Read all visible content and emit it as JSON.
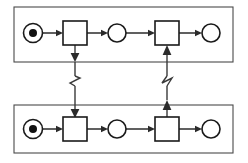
{
  "diagram": {
    "type": "petri-net",
    "canvas": {
      "width": 248,
      "height": 163,
      "background": "#ffffff"
    },
    "colors": {
      "lane_stroke": "#4a4a4a",
      "node_stroke": "#1a1a1a",
      "arc_stroke": "#2b2b2b",
      "message_stroke": "#3a3a3a",
      "token_fill": "#111111",
      "node_fill": "#ffffff"
    },
    "lanes": [
      {
        "id": "lane-top",
        "name": "top-pool",
        "x": 14,
        "y": 7,
        "width": 219,
        "height": 55
      },
      {
        "id": "lane-bottom",
        "name": "bottom-pool",
        "x": 14,
        "y": 105,
        "width": 219,
        "height": 48
      }
    ],
    "nodes": [
      {
        "id": "p-top-start",
        "kind": "place",
        "lane": "lane-top",
        "cx": 33,
        "cy": 33,
        "r": 9.5,
        "tokens": 1,
        "token_r": 4,
        "label": ""
      },
      {
        "id": "t-top-1",
        "kind": "transition",
        "lane": "lane-top",
        "x": 63,
        "y": 21,
        "width": 24,
        "height": 24,
        "label": ""
      },
      {
        "id": "p-top-mid",
        "kind": "place",
        "lane": "lane-top",
        "cx": 117,
        "cy": 33,
        "r": 9,
        "tokens": 0,
        "label": ""
      },
      {
        "id": "t-top-2",
        "kind": "transition",
        "lane": "lane-top",
        "x": 155,
        "y": 21,
        "width": 24,
        "height": 24,
        "label": ""
      },
      {
        "id": "p-top-end",
        "kind": "place",
        "lane": "lane-top",
        "cx": 211,
        "cy": 33,
        "r": 9,
        "tokens": 0,
        "label": ""
      },
      {
        "id": "p-bot-start",
        "kind": "place",
        "lane": "lane-bottom",
        "cx": 33,
        "cy": 129,
        "r": 9.5,
        "tokens": 1,
        "token_r": 4,
        "label": ""
      },
      {
        "id": "t-bot-1",
        "kind": "transition",
        "lane": "lane-bottom",
        "x": 63,
        "y": 117,
        "width": 24,
        "height": 24,
        "label": ""
      },
      {
        "id": "p-bot-mid",
        "kind": "place",
        "lane": "lane-bottom",
        "cx": 117,
        "cy": 129,
        "r": 9,
        "tokens": 0,
        "label": ""
      },
      {
        "id": "t-bot-2",
        "kind": "transition",
        "lane": "lane-bottom",
        "x": 155,
        "y": 117,
        "width": 24,
        "height": 24,
        "label": ""
      },
      {
        "id": "p-bot-end",
        "kind": "place",
        "lane": "lane-bottom",
        "cx": 211,
        "cy": 129,
        "r": 9,
        "tokens": 0,
        "label": ""
      }
    ],
    "arcs": [
      {
        "id": "arc-top-1",
        "from": "p-top-start",
        "to": "t-top-1",
        "orientation": "horizontal",
        "x1": 43,
        "y1": 33,
        "x2": 63,
        "y2": 33
      },
      {
        "id": "arc-top-2",
        "from": "t-top-1",
        "to": "p-top-mid",
        "orientation": "horizontal",
        "x1": 87,
        "y1": 33,
        "x2": 108,
        "y2": 33
      },
      {
        "id": "arc-top-3",
        "from": "p-top-mid",
        "to": "t-top-2",
        "orientation": "horizontal",
        "x1": 126,
        "y1": 33,
        "x2": 155,
        "y2": 33
      },
      {
        "id": "arc-top-4",
        "from": "t-top-2",
        "to": "p-top-end",
        "orientation": "horizontal",
        "x1": 179,
        "y1": 33,
        "x2": 202,
        "y2": 33
      },
      {
        "id": "arc-bot-1",
        "from": "p-bot-start",
        "to": "t-bot-1",
        "orientation": "horizontal",
        "x1": 43,
        "y1": 129,
        "x2": 63,
        "y2": 129
      },
      {
        "id": "arc-bot-2",
        "from": "t-bot-1",
        "to": "p-bot-mid",
        "orientation": "horizontal",
        "x1": 87,
        "y1": 129,
        "x2": 108,
        "y2": 129
      },
      {
        "id": "arc-bot-3",
        "from": "p-bot-mid",
        "to": "t-bot-2",
        "orientation": "horizontal",
        "x1": 126,
        "y1": 129,
        "x2": 155,
        "y2": 129
      },
      {
        "id": "arc-bot-4",
        "from": "t-bot-2",
        "to": "p-bot-end",
        "orientation": "horizontal",
        "x1": 179,
        "y1": 129,
        "x2": 202,
        "y2": 129
      }
    ],
    "message_flows": [
      {
        "id": "msg-left",
        "from": "t-top-1",
        "to": "t-bot-1",
        "direction": "down",
        "x": 75,
        "y1": 45,
        "y2": 117,
        "break_y": 81,
        "style": "zigzag-break"
      },
      {
        "id": "msg-right",
        "from": "t-bot-2",
        "to": "t-top-2",
        "direction": "up",
        "x": 167,
        "y1": 117,
        "y2": 45,
        "break_y": 81,
        "style": "zigzag-break"
      }
    ]
  }
}
